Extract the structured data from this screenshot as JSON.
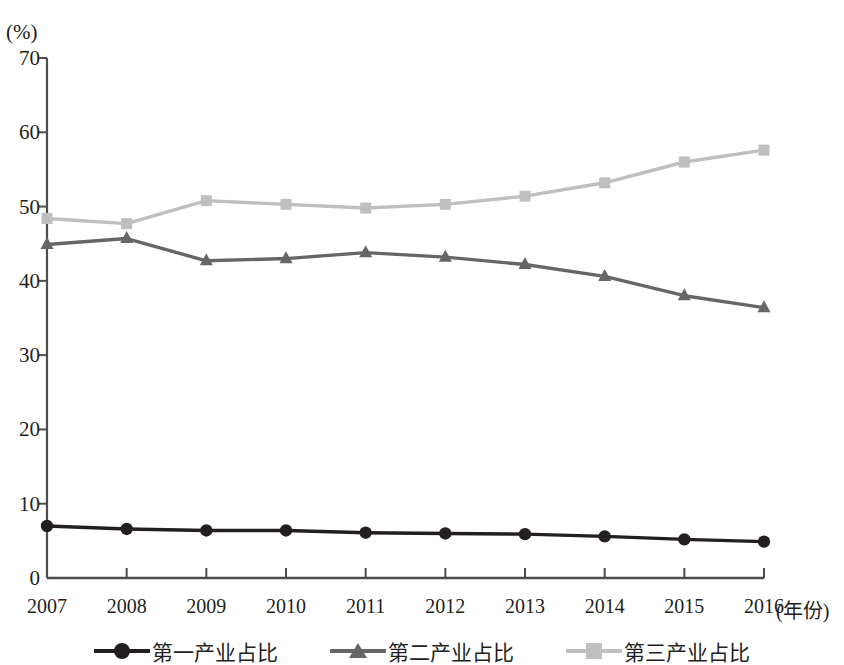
{
  "chart_data": {
    "type": "line",
    "title": "",
    "subtitle": "",
    "xlabel": "(年份)",
    "ylabel": "(%)",
    "x": [
      2007,
      2008,
      2009,
      2010,
      2011,
      2012,
      2013,
      2014,
      2015,
      2016
    ],
    "categories": [
      "2007",
      "2008",
      "2009",
      "2010",
      "2011",
      "2012",
      "2013",
      "2014",
      "2015",
      "2016"
    ],
    "xlim": [
      2007,
      2016
    ],
    "ylim": [
      0,
      70
    ],
    "yticks": [
      0,
      10,
      20,
      30,
      40,
      50,
      60,
      70
    ],
    "ytick_labels": [
      "0",
      "10",
      "20",
      "30",
      "40",
      "50",
      "60",
      "70"
    ],
    "grid": false,
    "legend_position": "bottom",
    "series": [
      {
        "name": "第一产业占比",
        "marker": "circle",
        "color": "#231f20",
        "values": [
          7.0,
          6.6,
          6.4,
          6.4,
          6.1,
          6.0,
          5.9,
          5.6,
          5.2,
          4.9
        ]
      },
      {
        "name": "第二产业占比",
        "marker": "triangle",
        "color": "#666666",
        "values": [
          44.9,
          45.7,
          42.7,
          43.0,
          43.8,
          43.2,
          42.2,
          40.6,
          38.0,
          36.4
        ]
      },
      {
        "name": "第三产业占比",
        "marker": "square",
        "color": "#bfbfbf",
        "values": [
          48.4,
          47.7,
          50.8,
          50.3,
          49.8,
          50.3,
          51.4,
          53.2,
          56.0,
          57.6
        ]
      }
    ]
  },
  "axes": {
    "y_unit": "(%)",
    "x_unit": "(年份)",
    "axis_color": "#4d4d4d"
  },
  "legend": {
    "items": [
      {
        "label": "第一产业占比",
        "marker": "circle-marker",
        "color": "#231f20"
      },
      {
        "label": "第二产业占比",
        "marker": "triangle-marker",
        "color": "#666666"
      },
      {
        "label": "第三产业占比",
        "marker": "square-marker",
        "color": "#bfbfbf"
      }
    ]
  }
}
